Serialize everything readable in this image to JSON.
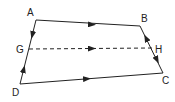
{
  "diagram": {
    "type": "quadrilateral-vector-diagram",
    "colors": {
      "line": "#222222",
      "background": "#ffffff"
    },
    "vertices": [
      {
        "id": "A",
        "label": "A",
        "x": 36,
        "y": 20,
        "lx": 27,
        "ly": 16
      },
      {
        "id": "B",
        "label": "B",
        "x": 140,
        "y": 26,
        "lx": 141,
        "ly": 22
      },
      {
        "id": "C",
        "label": "C",
        "x": 163,
        "y": 73,
        "lx": 162,
        "ly": 84
      },
      {
        "id": "D",
        "label": "D",
        "x": 20,
        "y": 84,
        "lx": 12,
        "ly": 96
      }
    ],
    "midpoints": [
      {
        "id": "G",
        "label": "G",
        "on": "AD",
        "x": 29,
        "y": 49,
        "lx": 16,
        "ly": 53
      },
      {
        "id": "H",
        "label": "H",
        "on": "BC",
        "x": 152,
        "y": 48,
        "lx": 155,
        "ly": 53
      }
    ],
    "segments": [
      {
        "from": "A",
        "to": "B",
        "style": "solid",
        "arrow": "A->B"
      },
      {
        "from": "D",
        "to": "C",
        "style": "solid",
        "arrow": "D->C"
      },
      {
        "from": "G",
        "to": "H",
        "style": "dashed",
        "arrow": "G->H"
      },
      {
        "from": "A",
        "to": "G",
        "style": "solid",
        "arrow": "A->G"
      },
      {
        "from": "D",
        "to": "G",
        "style": "solid",
        "arrow": "D->G"
      },
      {
        "from": "H",
        "to": "B",
        "style": "solid",
        "arrow": "H->B"
      },
      {
        "from": "H",
        "to": "C",
        "style": "solid",
        "arrow": "H->C"
      }
    ]
  },
  "labels": {
    "A": "A",
    "B": "B",
    "C": "C",
    "D": "D",
    "G": "G",
    "H": "H"
  }
}
